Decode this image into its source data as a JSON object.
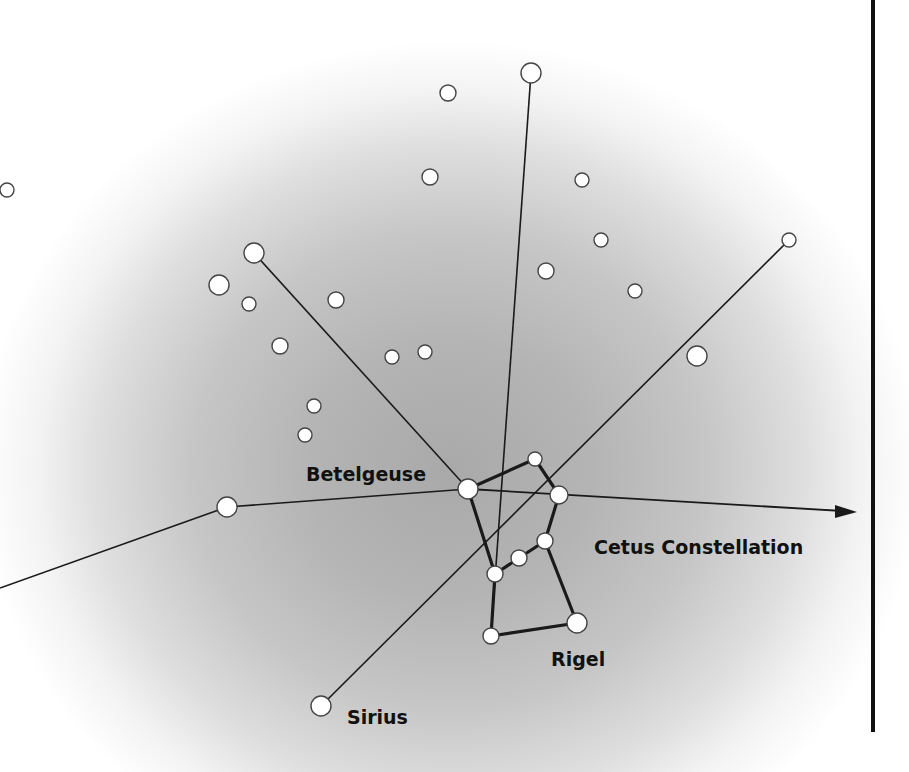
{
  "diagram": {
    "labels": {
      "betelgeuse": "Betelgeuse",
      "cetus": "Cetus Constellation",
      "rigel": "Rigel",
      "sirius": "Sirius"
    },
    "colors": {
      "star_fill": "#ffffff",
      "star_stroke": "#444444",
      "line": "#1a1a1a",
      "text": "#111111",
      "background_center": "#a9a9a9",
      "background_edge": "#ffffff"
    },
    "orion_stars": [
      {
        "name": "Betelgeuse",
        "x": 468,
        "y": 489,
        "r": 10
      },
      {
        "name": "head",
        "x": 535,
        "y": 459,
        "r": 7
      },
      {
        "name": "right-shoulder",
        "x": 559,
        "y": 495,
        "r": 9
      },
      {
        "name": "belt-right",
        "x": 545,
        "y": 541,
        "r": 8
      },
      {
        "name": "belt-middle",
        "x": 519,
        "y": 558,
        "r": 8
      },
      {
        "name": "belt-left",
        "x": 495,
        "y": 574,
        "r": 8
      },
      {
        "name": "left-foot",
        "x": 491,
        "y": 636,
        "r": 8
      },
      {
        "name": "Rigel",
        "x": 577,
        "y": 623,
        "r": 10
      }
    ],
    "pointer_stars": [
      {
        "name": "upper-left-target",
        "x": 254,
        "y": 253,
        "r": 10
      },
      {
        "name": "top-target",
        "x": 531,
        "y": 73,
        "r": 10
      },
      {
        "name": "left-target",
        "x": 227,
        "y": 507,
        "r": 10
      },
      {
        "name": "right-upper-target",
        "x": 789,
        "y": 240,
        "r": 7
      },
      {
        "name": "right-mid-target",
        "x": 697,
        "y": 356,
        "r": 10
      },
      {
        "name": "Sirius",
        "x": 321,
        "y": 706,
        "r": 10
      }
    ],
    "background_stars": [
      {
        "x": 448,
        "y": 93,
        "r": 8
      },
      {
        "x": 430,
        "y": 177,
        "r": 8
      },
      {
        "x": 582,
        "y": 180,
        "r": 7
      },
      {
        "x": 601,
        "y": 240,
        "r": 7
      },
      {
        "x": 546,
        "y": 271,
        "r": 8
      },
      {
        "x": 635,
        "y": 291,
        "r": 7
      },
      {
        "x": 219,
        "y": 285,
        "r": 10
      },
      {
        "x": 249,
        "y": 304,
        "r": 7
      },
      {
        "x": 336,
        "y": 300,
        "r": 8
      },
      {
        "x": 280,
        "y": 346,
        "r": 8
      },
      {
        "x": 392,
        "y": 357,
        "r": 7
      },
      {
        "x": 425,
        "y": 352,
        "r": 7
      },
      {
        "x": 314,
        "y": 406,
        "r": 7
      },
      {
        "x": 305,
        "y": 435,
        "r": 7
      },
      {
        "x": 7,
        "y": 190,
        "r": 7
      }
    ],
    "thin_lines": [
      {
        "x1": 468,
        "y1": 489,
        "x2": 254,
        "y2": 253
      },
      {
        "x1": 491,
        "y1": 636,
        "x2": 531,
        "y2": 73
      },
      {
        "x1": 321,
        "y1": 706,
        "x2": 789,
        "y2": 240
      },
      {
        "x1": 468,
        "y1": 489,
        "x2": 227,
        "y2": 507
      },
      {
        "x1": 227,
        "y1": 507,
        "x2": 0,
        "y2": 588
      }
    ],
    "arrow": {
      "x1": 468,
      "y1": 489,
      "x2": 857,
      "y2": 512
    },
    "figure_lines": [
      {
        "x1": 468,
        "y1": 489,
        "x2": 535,
        "y2": 459
      },
      {
        "x1": 535,
        "y1": 459,
        "x2": 559,
        "y2": 495
      },
      {
        "x1": 559,
        "y1": 495,
        "x2": 545,
        "y2": 541
      },
      {
        "x1": 545,
        "y1": 541,
        "x2": 519,
        "y2": 558
      },
      {
        "x1": 519,
        "y1": 558,
        "x2": 495,
        "y2": 574
      },
      {
        "x1": 468,
        "y1": 489,
        "x2": 495,
        "y2": 574
      },
      {
        "x1": 495,
        "y1": 574,
        "x2": 491,
        "y2": 636
      },
      {
        "x1": 491,
        "y1": 636,
        "x2": 577,
        "y2": 623
      },
      {
        "x1": 545,
        "y1": 541,
        "x2": 577,
        "y2": 623
      }
    ]
  }
}
